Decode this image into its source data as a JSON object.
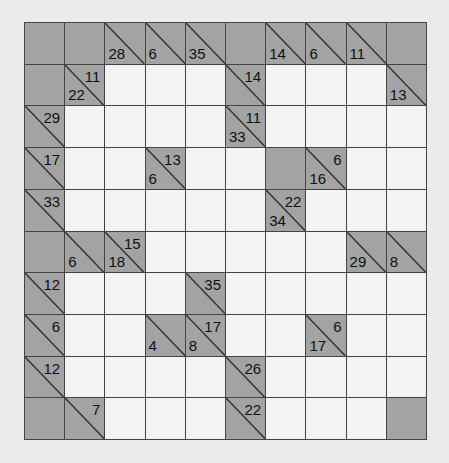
{
  "puzzle": {
    "type": "kakuro",
    "rows": 10,
    "cols": 10,
    "colors": {
      "block": "#a3a3a3",
      "white": "#f4f4f4",
      "line": "#444444",
      "background": "#ebebeb"
    },
    "grid": [
      [
        {
          "t": "B"
        },
        {
          "t": "B"
        },
        {
          "t": "C",
          "d": "28"
        },
        {
          "t": "C",
          "d": "6"
        },
        {
          "t": "C",
          "d": "35"
        },
        {
          "t": "B"
        },
        {
          "t": "C",
          "d": "14"
        },
        {
          "t": "C",
          "d": "6"
        },
        {
          "t": "C",
          "d": "11"
        },
        {
          "t": "B"
        }
      ],
      [
        {
          "t": "B"
        },
        {
          "t": "C",
          "a": "11",
          "d": "22"
        },
        {
          "t": "W"
        },
        {
          "t": "W"
        },
        {
          "t": "W"
        },
        {
          "t": "C",
          "a": "14"
        },
        {
          "t": "W"
        },
        {
          "t": "W"
        },
        {
          "t": "W"
        },
        {
          "t": "C",
          "d": "13"
        }
      ],
      [
        {
          "t": "C",
          "a": "29"
        },
        {
          "t": "W"
        },
        {
          "t": "W"
        },
        {
          "t": "W"
        },
        {
          "t": "W"
        },
        {
          "t": "C",
          "a": "11",
          "d": "33"
        },
        {
          "t": "W"
        },
        {
          "t": "W"
        },
        {
          "t": "W"
        },
        {
          "t": "W"
        }
      ],
      [
        {
          "t": "C",
          "a": "17"
        },
        {
          "t": "W"
        },
        {
          "t": "W"
        },
        {
          "t": "C",
          "a": "13",
          "d": "6"
        },
        {
          "t": "W"
        },
        {
          "t": "W"
        },
        {
          "t": "B"
        },
        {
          "t": "C",
          "a": "6",
          "d": "16"
        },
        {
          "t": "W"
        },
        {
          "t": "W"
        }
      ],
      [
        {
          "t": "C",
          "a": "33"
        },
        {
          "t": "W"
        },
        {
          "t": "W"
        },
        {
          "t": "W"
        },
        {
          "t": "W"
        },
        {
          "t": "W"
        },
        {
          "t": "C",
          "a": "22",
          "d": "34"
        },
        {
          "t": "W"
        },
        {
          "t": "W"
        },
        {
          "t": "W"
        }
      ],
      [
        {
          "t": "B"
        },
        {
          "t": "C",
          "d": "6"
        },
        {
          "t": "C",
          "a": "15",
          "d": "18"
        },
        {
          "t": "W"
        },
        {
          "t": "W"
        },
        {
          "t": "W"
        },
        {
          "t": "W"
        },
        {
          "t": "W"
        },
        {
          "t": "C",
          "d": "29"
        },
        {
          "t": "C",
          "d": "8"
        }
      ],
      [
        {
          "t": "C",
          "a": "12"
        },
        {
          "t": "W"
        },
        {
          "t": "W"
        },
        {
          "t": "W"
        },
        {
          "t": "C",
          "a": "35"
        },
        {
          "t": "W"
        },
        {
          "t": "W"
        },
        {
          "t": "W"
        },
        {
          "t": "W"
        },
        {
          "t": "W"
        }
      ],
      [
        {
          "t": "C",
          "a": "6"
        },
        {
          "t": "W"
        },
        {
          "t": "W"
        },
        {
          "t": "C",
          "d": "4"
        },
        {
          "t": "C",
          "a": "17",
          "d": "8"
        },
        {
          "t": "W"
        },
        {
          "t": "W"
        },
        {
          "t": "C",
          "a": "6",
          "d": "17"
        },
        {
          "t": "W"
        },
        {
          "t": "W"
        }
      ],
      [
        {
          "t": "C",
          "a": "12"
        },
        {
          "t": "W"
        },
        {
          "t": "W"
        },
        {
          "t": "W"
        },
        {
          "t": "W"
        },
        {
          "t": "C",
          "a": "26"
        },
        {
          "t": "W"
        },
        {
          "t": "W"
        },
        {
          "t": "W"
        },
        {
          "t": "W"
        }
      ],
      [
        {
          "t": "B"
        },
        {
          "t": "C",
          "a": "7"
        },
        {
          "t": "W"
        },
        {
          "t": "W"
        },
        {
          "t": "W"
        },
        {
          "t": "C",
          "a": "22"
        },
        {
          "t": "W"
        },
        {
          "t": "W"
        },
        {
          "t": "W"
        },
        {
          "t": "B"
        }
      ]
    ]
  }
}
